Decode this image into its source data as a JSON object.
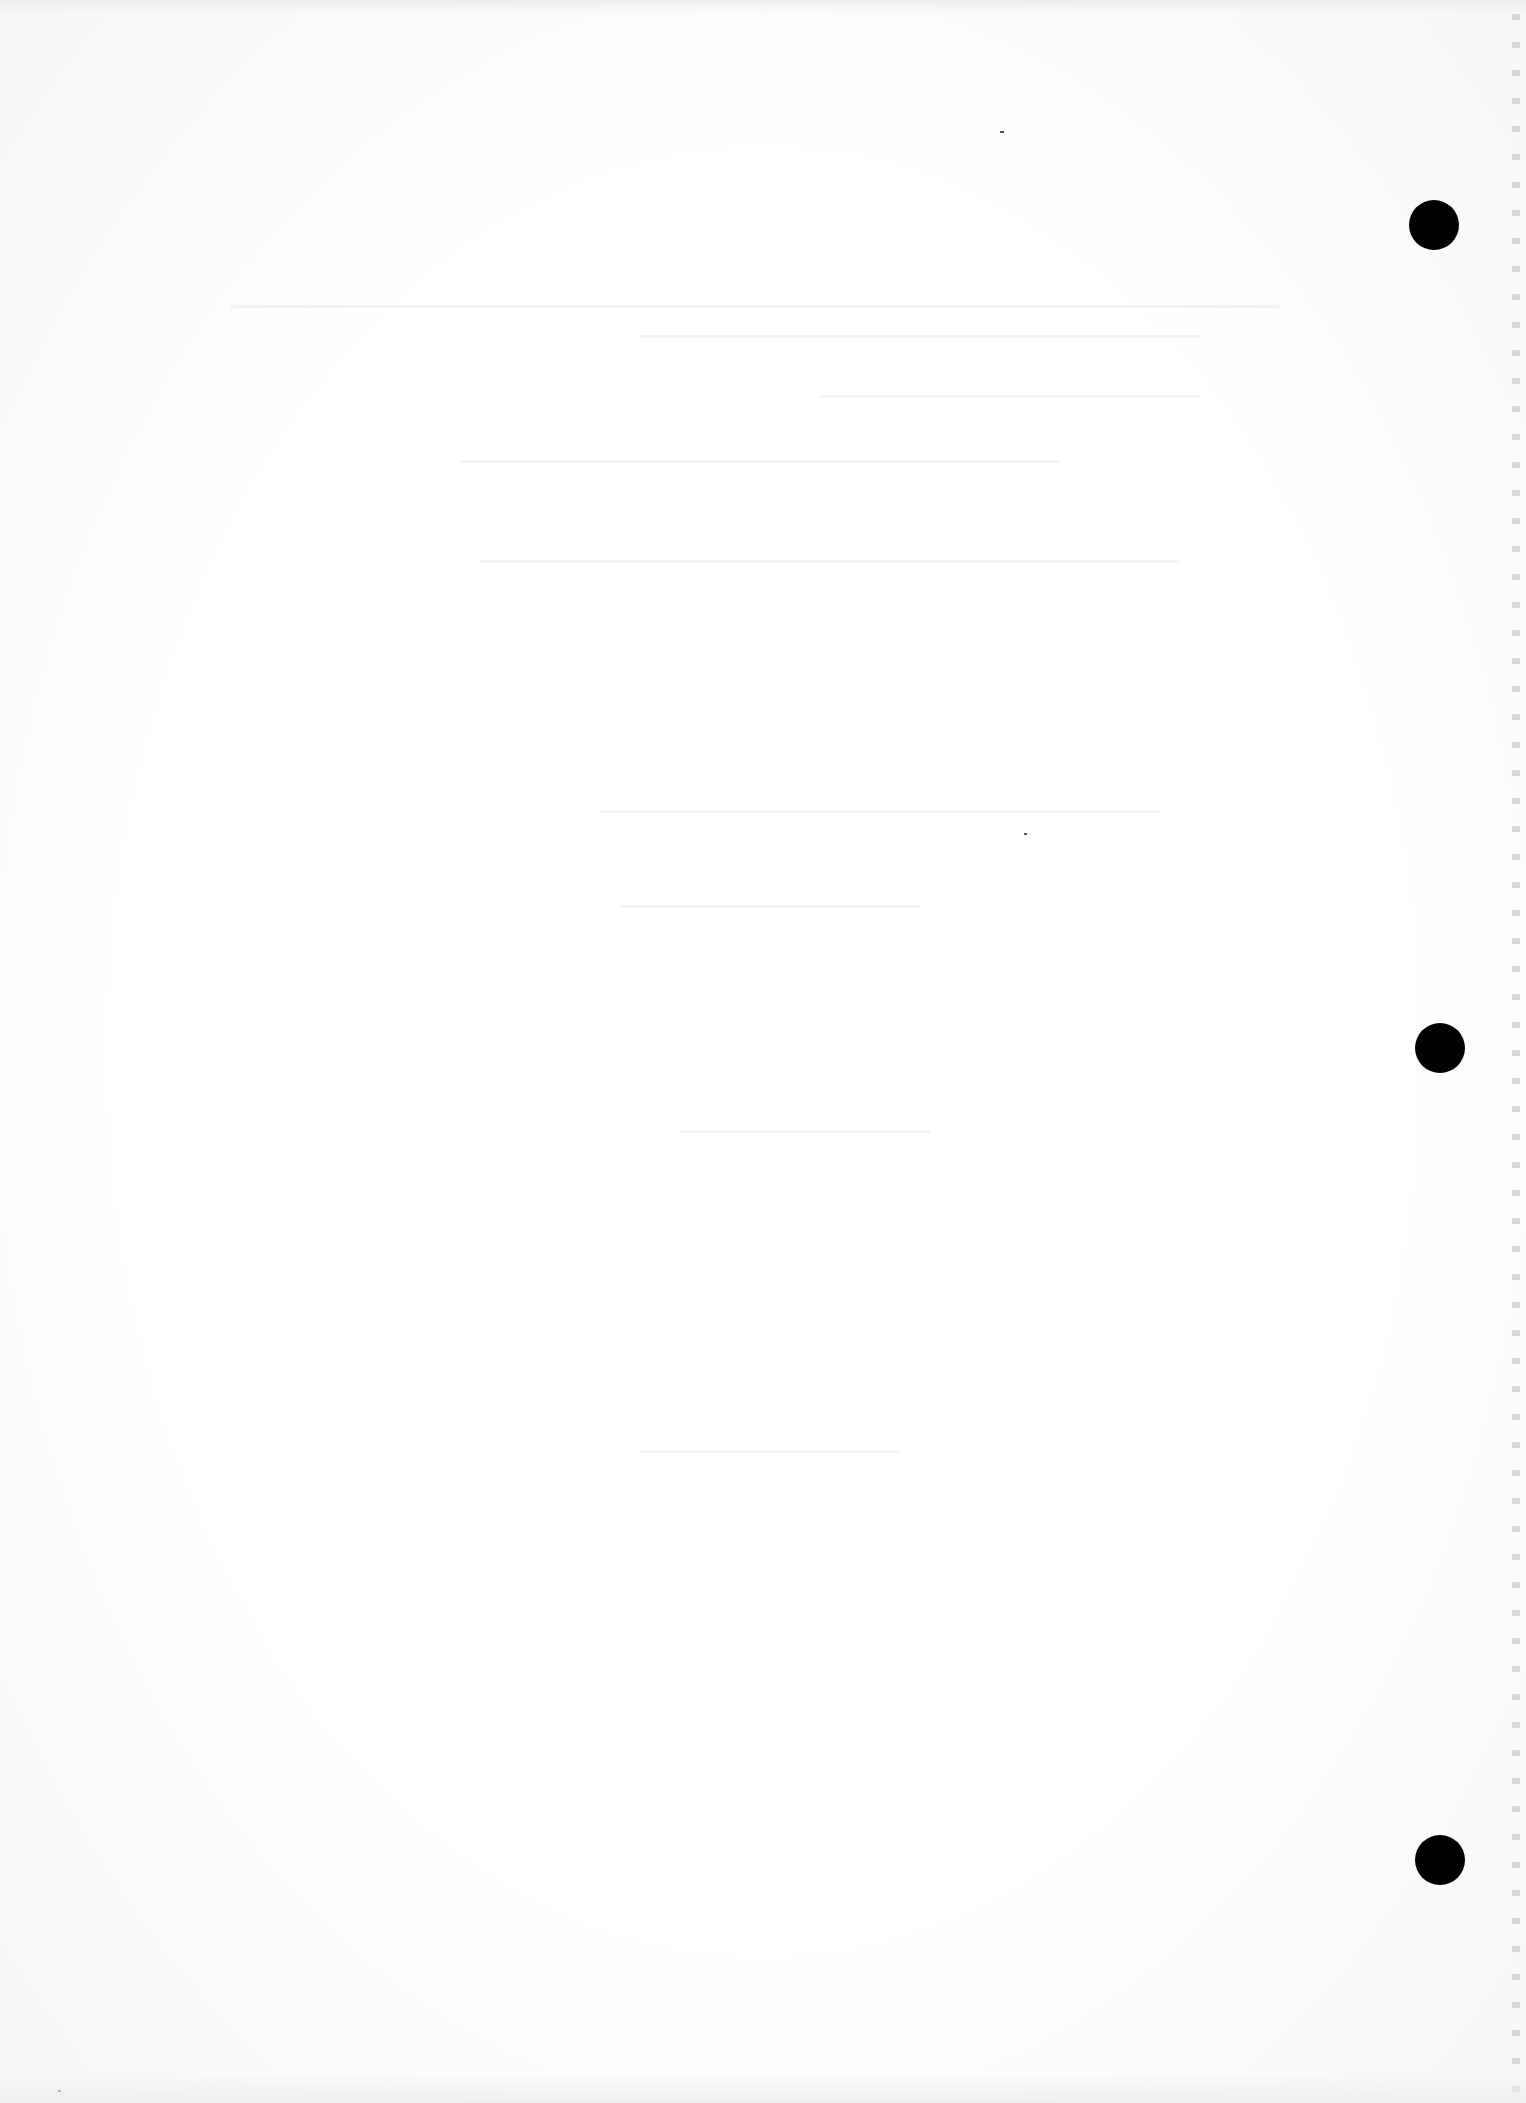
{
  "page": {
    "type": "blank scanned page (reverse side)",
    "background_color": "#fdfdfd",
    "legible_text": []
  },
  "punch_holes": [
    {
      "label": "top-hole",
      "cx": 1434,
      "cy": 225,
      "r": 25
    },
    {
      "label": "middle-hole",
      "cx": 1440,
      "cy": 1048,
      "r": 25
    },
    {
      "label": "bottom-hole",
      "cx": 1440,
      "cy": 1860,
      "r": 25
    }
  ],
  "colors": {
    "hole": "#000000",
    "paper": "#ffffff",
    "bleed_through": "#f3f3f3",
    "perforation": "#c9c9c9"
  }
}
